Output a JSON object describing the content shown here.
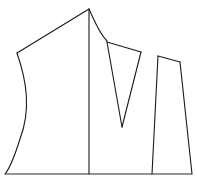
{
  "figure": {
    "canvas": {
      "width": 197,
      "height": 181,
      "background_color": "#ffffff"
    },
    "style": {
      "stroke_color": "#1a1a1a",
      "baseline_stroke_color": "#2b2b2b",
      "stroke_width": 1.1,
      "fill_color": "#ffffff"
    },
    "shapes": [
      {
        "name": "left-curved-panel",
        "label": "Left curved panel",
        "path": "M 89 9 L 17 53 C 27 82 31 110 20 139 C 15 155 10 168 5 174 L 89 174 Z",
        "vertices": [
          [
            89,
            9
          ],
          [
            17,
            53
          ],
          [
            5,
            174
          ],
          [
            89,
            174
          ]
        ]
      },
      {
        "name": "center-panel",
        "label": "Center panel with concave top",
        "path": "M 89 9 C 95 22 99 33 107 41 L 122 127 L 89 174 Z",
        "vertices": [
          [
            89,
            9
          ],
          [
            107,
            41
          ],
          [
            122,
            127
          ],
          [
            89,
            174
          ]
        ]
      },
      {
        "name": "narrow-wedge",
        "label": "Narrow triangular wedge",
        "path": "M 107 42 L 141 52 L 122 127 Z",
        "vertices": [
          [
            107,
            42
          ],
          [
            141,
            52
          ],
          [
            122,
            127
          ]
        ]
      },
      {
        "name": "right-panel",
        "label": "Right quadrilateral panel",
        "path": "M 158 56 L 180 62 L 192 174 L 152 174 Z",
        "vertices": [
          [
            158,
            56
          ],
          [
            180,
            62
          ],
          [
            192,
            174
          ],
          [
            152,
            174
          ]
        ]
      }
    ],
    "lines": [
      {
        "name": "ground-baseline",
        "label": "Horizontal ground baseline",
        "path": "M 5 174 L 192 174",
        "from": [
          5,
          174
        ],
        "to": [
          192,
          174
        ]
      },
      {
        "name": "center-vertical-divider",
        "label": "Vertical divider line",
        "path": "M 89 9 L 89 174",
        "from": [
          89,
          9
        ],
        "to": [
          89,
          174
        ]
      },
      {
        "name": "left-upper-edge",
        "label": "Upper left straight edge",
        "path": "M 89 9 L 17 53"
      },
      {
        "name": "left-s-curve-edge",
        "label": "Left S-curve edge",
        "path": "M 17 53 C 27 82 31 110 20 139 C 15 155 10 168 5 174"
      },
      {
        "name": "center-concave-curve",
        "label": "Concave curve from apex",
        "path": "M 89 9 C 95 22 99 33 107 41"
      },
      {
        "name": "wedge-top-edge",
        "label": "Wedge top edge",
        "path": "M 107 42 L 141 52"
      },
      {
        "name": "wedge-left-edge",
        "label": "Wedge left edge",
        "path": "M 107 42 L 122 127"
      },
      {
        "name": "wedge-right-edge",
        "label": "Wedge right edge",
        "path": "M 141 52 L 122 127"
      },
      {
        "name": "right-panel-top-edge",
        "label": "Right panel top edge",
        "path": "M 158 56 L 180 62"
      },
      {
        "name": "right-panel-left-edge",
        "label": "Right panel left edge",
        "path": "M 158 56 L 152 174"
      },
      {
        "name": "right-panel-right-edge",
        "label": "Right panel right edge",
        "path": "M 180 62 L 192 174"
      }
    ]
  }
}
